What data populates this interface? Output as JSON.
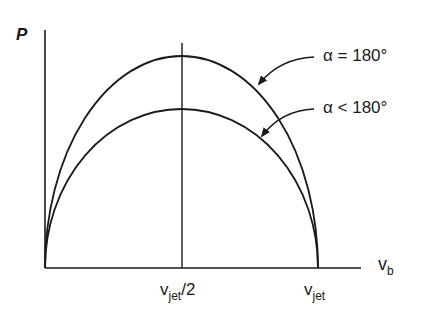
{
  "diagram": {
    "y_axis_label": "P",
    "x_axis_label": {
      "main": "v",
      "sub": "b"
    },
    "x_ticks": [
      {
        "main": "v",
        "sub": "jet",
        "suffix": "/2"
      },
      {
        "main": "v",
        "sub": "jet",
        "suffix": ""
      }
    ],
    "curves": [
      {
        "label": "α = 180°",
        "description": "outer curve (higher peak)"
      },
      {
        "label": "α < 180°",
        "description": "inner curve (lower peak)"
      }
    ],
    "colors": {
      "line": "#1a1a1a",
      "background": "#ffffff"
    }
  }
}
